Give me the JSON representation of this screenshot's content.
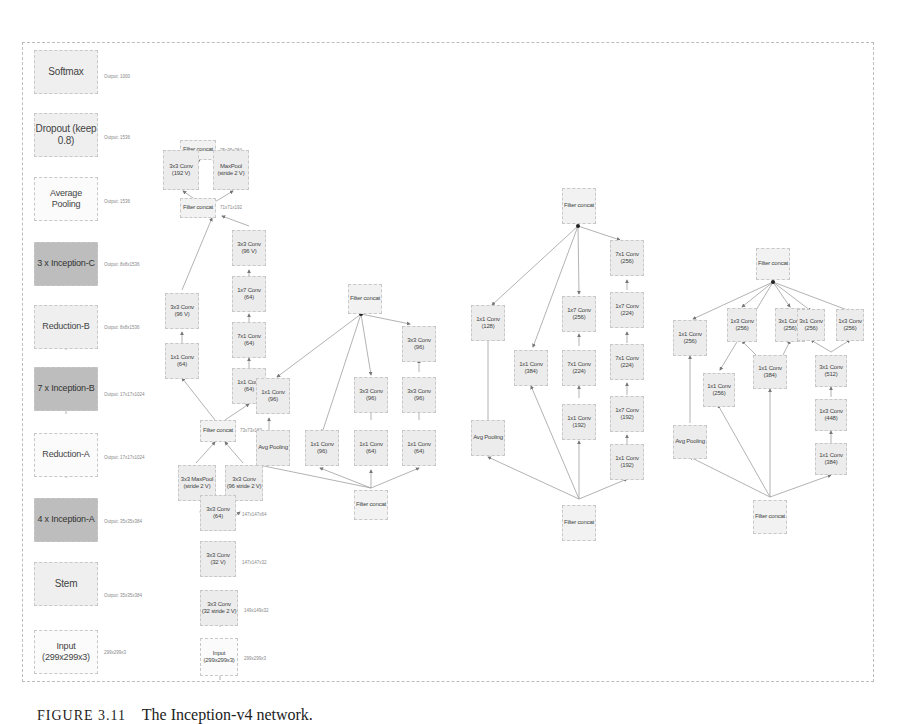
{
  "caption": {
    "figure": "FIGURE 3.11",
    "text": "The Inception-v4 network."
  },
  "main_column": [
    {
      "label": "Softmax",
      "output": "Output: 1000",
      "style": "main"
    },
    {
      "label": "Dropout (keep 0.8)",
      "output": "Output: 1536",
      "style": "main"
    },
    {
      "label": "Average Pooling",
      "output": "Output: 1536",
      "style": "white"
    },
    {
      "label": "3 x Inception-C",
      "output": "Output: 8x8x1536",
      "style": "dark"
    },
    {
      "label": "Reduction-B",
      "output": "Output: 8x8x1536",
      "style": "main"
    },
    {
      "label": "7 x Inception-B",
      "output": "Output: 17x17x1024",
      "style": "dark"
    },
    {
      "label": "Reduction-A",
      "output": "Output: 17x17x1024",
      "style": "white"
    },
    {
      "label": "4 x Inception-A",
      "output": "Output: 35x35x384",
      "style": "dark"
    },
    {
      "label": "Stem",
      "output": "Output: 35x35x384",
      "style": "main"
    },
    {
      "label": "Input (299x299x3)",
      "output": "299x299x3",
      "style": "white"
    }
  ],
  "stem": {
    "nodes": [
      {
        "id": "s_fc3",
        "label": "Filter concat",
        "output": "35x35x384"
      },
      {
        "id": "s_conv192",
        "label": "3x3 Conv\n(192 V)"
      },
      {
        "id": "s_maxpool2",
        "label": "MaxPool\n(stride 2 V)"
      },
      {
        "id": "s_fc2",
        "label": "Filter concat",
        "output": "71x71x192"
      },
      {
        "id": "s_b1_3x3",
        "label": "3x3 Conv\n(96 V)"
      },
      {
        "id": "s_b1_1x1",
        "label": "1x1 Conv\n(64)"
      },
      {
        "id": "s_b2_3x3",
        "label": "3x3 Conv\n(96 V)"
      },
      {
        "id": "s_b2_1x7",
        "label": "1x7 Conv\n(64)"
      },
      {
        "id": "s_b2_7x1",
        "label": "7x1 Conv\n(64)"
      },
      {
        "id": "s_b2_1x1",
        "label": "1x1 Conv\n(64)"
      },
      {
        "id": "s_fc1",
        "label": "Filter concat",
        "output": "73x73x160"
      },
      {
        "id": "s_maxpool1",
        "label": "3x3 MaxPool\n(stride 2 V)"
      },
      {
        "id": "s_conv96",
        "label": "3x3 Conv\n(96 stride 2 V)"
      },
      {
        "id": "s_conv64",
        "label": "3x3 Conv\n(64)",
        "output": "147x147x64"
      },
      {
        "id": "s_conv32v",
        "label": "3x3 Conv\n(32 V)",
        "output": "147x147x32"
      },
      {
        "id": "s_conv32s2",
        "label": "3x3 Conv\n(32 stride 2 V)",
        "output": "149x149x32"
      },
      {
        "id": "s_input",
        "label": "Input\n(299x299x3)",
        "output": "299x299x3"
      }
    ]
  },
  "inception_a": {
    "nodes": [
      {
        "id": "a_top",
        "label": "Filter concat"
      },
      {
        "id": "a_b1_1x1",
        "label": "1x1 Conv\n(96)"
      },
      {
        "id": "a_b1_pool",
        "label": "Avg Pooling"
      },
      {
        "id": "a_b2_1x1",
        "label": "1x1 Conv\n(96)"
      },
      {
        "id": "a_b3_3x3",
        "label": "3x3 Conv\n(96)"
      },
      {
        "id": "a_b3_1x1",
        "label": "1x1 Conv\n(64)"
      },
      {
        "id": "a_b4_3x3a",
        "label": "3x3 Conv\n(96)"
      },
      {
        "id": "a_b4_3x3b",
        "label": "3x3 Conv\n(96)"
      },
      {
        "id": "a_b4_1x1",
        "label": "1x1 Conv\n(64)"
      },
      {
        "id": "a_bottom",
        "label": "Filter concat"
      }
    ]
  },
  "inception_b": {
    "nodes": [
      {
        "id": "b_top",
        "label": "Filter concat"
      },
      {
        "id": "b_b1_1x1",
        "label": "1x1 Conv\n(128)"
      },
      {
        "id": "b_b1_pool",
        "label": "Avg Pooling"
      },
      {
        "id": "b_b2_1x1",
        "label": "1x1 Conv\n(384)"
      },
      {
        "id": "b_b3_1x7",
        "label": "1x7 Conv\n(256)"
      },
      {
        "id": "b_b3_7x1",
        "label": "7x1 Conv\n(224)"
      },
      {
        "id": "b_b3_1x1",
        "label": "1x1 Conv\n(192)"
      },
      {
        "id": "b_b4_7x1a",
        "label": "7x1 Conv\n(256)"
      },
      {
        "id": "b_b4_1x7a",
        "label": "1x7 Conv\n(224)"
      },
      {
        "id": "b_b4_7x1b",
        "label": "7x1 Conv\n(224)"
      },
      {
        "id": "b_b4_1x7b",
        "label": "1x7 Conv\n(192)"
      },
      {
        "id": "b_b4_1x1",
        "label": "1x1 Conv\n(192)"
      },
      {
        "id": "b_bottom",
        "label": "Filter concat"
      }
    ]
  },
  "inception_c": {
    "nodes": [
      {
        "id": "c_top",
        "label": "Filter concat"
      },
      {
        "id": "c_b1_1x1",
        "label": "1x1 Conv\n(256)"
      },
      {
        "id": "c_b1_pool",
        "label": "Avg Pooling"
      },
      {
        "id": "c_b2_1x1",
        "label": "1x1 Conv\n(256)"
      },
      {
        "id": "c_b3_1x3",
        "label": "1x3 Conv\n(256)"
      },
      {
        "id": "c_b3_3x1",
        "label": "3x1 Conv\n(256)"
      },
      {
        "id": "c_b3_1x1",
        "label": "1x1 Conv\n(384)"
      },
      {
        "id": "c_b4_3x1",
        "label": "3x1 Conv\n(256)"
      },
      {
        "id": "c_b4_1x3",
        "label": "1x3 Conv\n(256)"
      },
      {
        "id": "c_b4_3x1b",
        "label": "3x1 Conv\n(512)"
      },
      {
        "id": "c_b4_1x3b",
        "label": "1x3 Conv\n(448)"
      },
      {
        "id": "c_b4_1x1",
        "label": "1x1 Conv\n(384)"
      },
      {
        "id": "c_bottom",
        "label": "Filter concat"
      }
    ]
  },
  "colors": {
    "node_fill": "#ececec",
    "node_dark": "#bdbdbd",
    "node_border": "#c8c8c8",
    "edge": "#9a9a9a",
    "frame": "#bdbdbd"
  }
}
